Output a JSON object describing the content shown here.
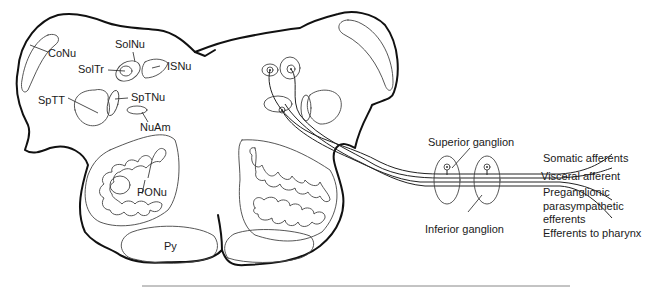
{
  "figure": {
    "type": "anatomical cross-section",
    "nuclei_labels": [
      {
        "id": "conu",
        "text": "CoNu"
      },
      {
        "id": "solnu",
        "text": "SolNu"
      },
      {
        "id": "soltr",
        "text": "SolTr"
      },
      {
        "id": "isnu",
        "text": "ISNu"
      },
      {
        "id": "sptt",
        "text": "SpTT"
      },
      {
        "id": "sptnu",
        "text": "SpTNu"
      },
      {
        "id": "nuam",
        "text": "NuAm"
      },
      {
        "id": "ponu",
        "text": "PONu"
      },
      {
        "id": "py",
        "text": "Py"
      }
    ],
    "ganglia_labels": {
      "superior": "Superior ganglion",
      "inferior": "Inferior ganglion"
    },
    "fiber_labels": [
      "Somatic afferents",
      "Visceral afferent",
      "Preganglionic",
      "parasympathetic",
      "efferents",
      "Efferents to pharynx"
    ]
  }
}
